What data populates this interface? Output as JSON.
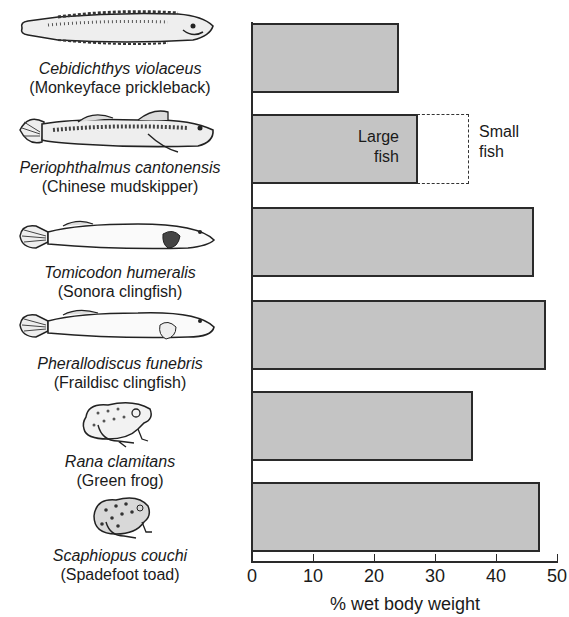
{
  "chart_data": {
    "type": "bar",
    "orientation": "horizontal",
    "title": "",
    "xlabel": "% wet body weight",
    "ylabel": "",
    "xlim": [
      0,
      50
    ],
    "xticks": [
      "0",
      "10",
      "20",
      "30",
      "40",
      "50"
    ],
    "grid": false,
    "legend": null,
    "categories": [
      {
        "scientific": "Cebidichthys violaceus",
        "common": "(Monkeyface prickleback)",
        "icon": "elongated-fish-icon"
      },
      {
        "scientific": "Periophthalmus cantonensis",
        "common": "(Chinese mudskipper)",
        "icon": "mudskipper-icon"
      },
      {
        "scientific": "Tomicodon humeralis",
        "common": "(Sonora clingfish)",
        "icon": "clingfish-icon"
      },
      {
        "scientific": "Pherallodiscus funebris",
        "common": "(Fraildisc clingfish)",
        "icon": "clingfish-icon"
      },
      {
        "scientific": "Rana clamitans",
        "common": "(Green frog)",
        "icon": "frog-icon"
      },
      {
        "scientific": "Scaphiopus couchi",
        "common": "(Spadefoot toad)",
        "icon": "toad-icon"
      }
    ],
    "values": [
      24,
      27,
      46,
      48,
      36,
      47
    ],
    "annotations": [
      {
        "category_index": 1,
        "label_inside": "Large fish",
        "value": 27
      },
      {
        "category_index": 1,
        "label_outside": "Small fish",
        "value": 35.5,
        "style": "dashed"
      }
    ],
    "colors": {
      "bar_fill": "#c4c4c4",
      "bar_edge": "#2a2a2a"
    }
  },
  "labels": {
    "large_fish_l1": "Large",
    "large_fish_l2": "fish",
    "small_fish_l1": "Small",
    "small_fish_l2": "fish"
  }
}
